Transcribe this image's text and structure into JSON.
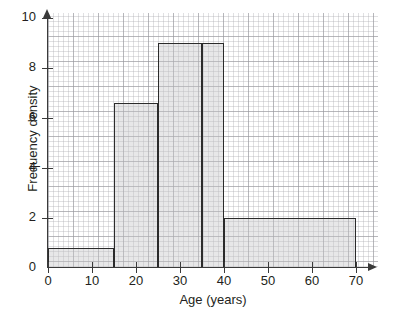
{
  "chart_data": {
    "type": "bar",
    "title": "",
    "subtitle": "",
    "xlabel": "Age (years)",
    "ylabel": "Frequency density",
    "xlim": [
      0,
      70
    ],
    "ylim": [
      0,
      11
    ],
    "grid": true,
    "legend": null,
    "x_ticks": [
      0,
      10,
      20,
      30,
      40,
      50,
      60,
      70
    ],
    "x_tick_labels": [
      "0",
      "10",
      "20",
      "30",
      "40",
      "50",
      "60",
      "70"
    ],
    "y_ticks": [
      0,
      2,
      4,
      6,
      8,
      10
    ],
    "y_tick_labels": [
      "0",
      "2",
      "4",
      "6",
      "8",
      "10"
    ],
    "bins": [
      {
        "label": "0-15",
        "x_start": 0,
        "x_end": 15,
        "frequency_density": 0.8
      },
      {
        "label": "15-25",
        "x_start": 15,
        "x_end": 25,
        "frequency_density": 6.6
      },
      {
        "label": "25-35",
        "x_start": 25,
        "x_end": 35,
        "frequency_density": 9.0
      },
      {
        "label": "35-40",
        "x_start": 35,
        "x_end": 40,
        "frequency_density": 9.0
      },
      {
        "label": "40-70",
        "x_start": 40,
        "x_end": 70,
        "frequency_density": 2.0
      }
    ],
    "categories": [
      "0-15",
      "15-25",
      "25-35",
      "35-40",
      "40-70"
    ],
    "values": [
      0.8,
      6.6,
      9.0,
      9.0,
      2.0
    ]
  },
  "style": {
    "bar_fill": "#c4c4c6",
    "bar_stroke": "#2b2b2b",
    "axis_color": "#3a3a3a",
    "grid_major": "#96969b",
    "grid_minor": "#afafb4",
    "text_color": "#231f20",
    "background": "#ffffff"
  }
}
